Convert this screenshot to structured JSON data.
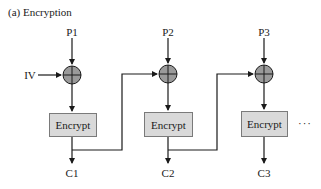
{
  "title": "(a) Encryption",
  "iv_label": "IV",
  "stages": [
    {
      "plaintext": "P1",
      "block": "Encrypt",
      "ciphertext": "C1"
    },
    {
      "plaintext": "P2",
      "block": "Encrypt",
      "ciphertext": "C2"
    },
    {
      "plaintext": "P3",
      "block": "Encrypt",
      "ciphertext": "C3"
    }
  ],
  "continuation": "···",
  "colors": {
    "line": "#1a1a1a",
    "xor_fill": "#9a9a9a",
    "block_fill": "#d9d9d9",
    "block_border": "#7a7a7a"
  },
  "xor_symbol": "xor-circle-plus"
}
